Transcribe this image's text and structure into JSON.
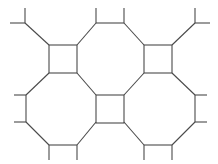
{
  "figure": {
    "kind": "geometric-tiling-diagram",
    "vertex_configuration": "4.8.8",
    "canvas": {
      "width": 218,
      "height": 164,
      "background_color": "#ffffff"
    },
    "style": {
      "stroke_color": "#4a4a4a",
      "stroke_width": 1.1,
      "fill_color": "none"
    },
    "counts": {
      "full_squares": 3,
      "partial_octagons": 4,
      "edge_stubs": 16
    }
  },
  "geometry": {
    "grid": {
      "period_x": 95,
      "period_y": 95,
      "square_side": 28,
      "origin_x": 49,
      "origin_y": 45
    },
    "squares": [
      {
        "name": "top-left-square",
        "x": 49,
        "y": 45,
        "size": 28
      },
      {
        "name": "top-right-square",
        "x": 144,
        "y": 45,
        "size": 28
      },
      {
        "name": "center-square",
        "x": 96,
        "y": 95,
        "size": 28
      }
    ],
    "polylines": [
      {
        "name": "top-left-stub-vertical",
        "points": "25,8 25,23"
      },
      {
        "name": "top-left-stub-horizontal",
        "points": "10,23 25,23"
      },
      {
        "name": "top-left-diagonal",
        "points": "25,23 49,45"
      },
      {
        "name": "top-mid-left-stub-vertical",
        "points": "96,8 96,23"
      },
      {
        "name": "top-mid-horizontal",
        "points": "96,23 124,23"
      },
      {
        "name": "top-mid-right-stub-vertical",
        "points": "124,8 124,23"
      },
      {
        "name": "top-mid-left-diagonal",
        "points": "96,23 77,45"
      },
      {
        "name": "top-mid-right-diagonal",
        "points": "124,23 144,45"
      },
      {
        "name": "top-right-stub-vertical",
        "points": "195,8 195,23"
      },
      {
        "name": "top-right-stub-horizontal",
        "points": "195,23 210,23"
      },
      {
        "name": "top-right-diagonal",
        "points": "195,23 172,45"
      },
      {
        "name": "left-upper-diagonal",
        "points": "49,73 26,95"
      },
      {
        "name": "left-upper-stub",
        "points": "14,95 26,95"
      },
      {
        "name": "left-vertical",
        "points": "26,95 26,122"
      },
      {
        "name": "left-lower-stub",
        "points": "14,122 26,122"
      },
      {
        "name": "left-lower-diagonal",
        "points": "26,122 49,145"
      },
      {
        "name": "center-upper-left-diagonal",
        "points": "77,73 96,95"
      },
      {
        "name": "center-upper-right-diagonal",
        "points": "144,73 124,95"
      },
      {
        "name": "center-lower-left-diagonal",
        "points": "96,122 77,145"
      },
      {
        "name": "center-lower-right-diagonal",
        "points": "124,122 144,145"
      },
      {
        "name": "right-upper-diagonal",
        "points": "172,73 195,95"
      },
      {
        "name": "right-upper-stub",
        "points": "195,95 207,95"
      },
      {
        "name": "right-vertical",
        "points": "195,95 195,122"
      },
      {
        "name": "right-lower-stub",
        "points": "195,122 207,122"
      },
      {
        "name": "right-lower-diagonal",
        "points": "195,122 172,145"
      },
      {
        "name": "bottom-left-horizontal",
        "points": "49,145 77,145"
      },
      {
        "name": "bottom-left-stub-a",
        "points": "49,145 49,160"
      },
      {
        "name": "bottom-left-stub-b",
        "points": "77,145 77,160"
      },
      {
        "name": "bottom-right-horizontal",
        "points": "144,145 172,145"
      },
      {
        "name": "bottom-right-stub-a",
        "points": "144,145 144,160"
      },
      {
        "name": "bottom-right-stub-b",
        "points": "172,145 172,160"
      },
      {
        "name": "bottom-mid-left-diagonal",
        "points": "26,122 26,122"
      },
      {
        "name": "bottom-far-left-stub",
        "points": "26,145 26,145"
      }
    ]
  }
}
